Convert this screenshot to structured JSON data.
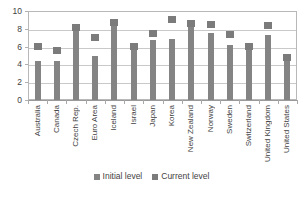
{
  "chart_data": {
    "type": "bar",
    "title": "",
    "subtitle": "",
    "xlabel": "",
    "ylabel": "",
    "ylim": [
      0,
      10
    ],
    "yticks": [
      0,
      2,
      4,
      6,
      8,
      10
    ],
    "ytick_labels": [
      "0",
      "2",
      "4",
      "6",
      "8",
      "10"
    ],
    "grid": true,
    "grid_axis": "y",
    "legend_position": "bottom-center",
    "categories": [
      "Australia",
      "Canada",
      "Czech Rep.",
      "Euro Area",
      "Iceland",
      "Israel",
      "Japan",
      "Korea",
      "New Zealand",
      "Norway",
      "Sweden",
      "Switzerland",
      "United Kingdom",
      "United States"
    ],
    "series": [
      {
        "name": "Initial level",
        "marker": "bar",
        "color": "#848484",
        "values": [
          4.4,
          4.4,
          7.9,
          4.9,
          8.4,
          5.8,
          6.7,
          6.8,
          8.3,
          7.5,
          6.2,
          5.8,
          7.3,
          4.5
        ]
      },
      {
        "name": "Current level",
        "marker": "square",
        "color": "#7b7b7b",
        "values": [
          6.0,
          5.6,
          8.2,
          7.0,
          8.7,
          6.0,
          7.5,
          9.0,
          8.6,
          8.5,
          7.4,
          6.0,
          8.4,
          4.8
        ]
      }
    ]
  },
  "legend": {
    "items": [
      {
        "label": "Initial level",
        "color": "#848484"
      },
      {
        "label": "Current level",
        "color": "#7b7b7b"
      }
    ]
  },
  "axis": {
    "y_tick_labels": [
      "0",
      "2",
      "4",
      "6",
      "8",
      "10"
    ]
  }
}
